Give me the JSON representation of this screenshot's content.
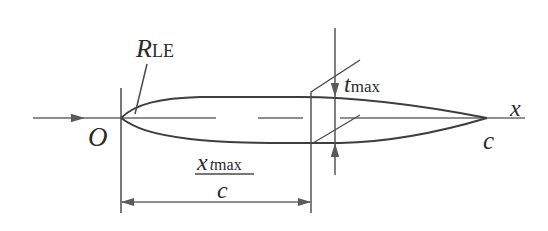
{
  "diagram": {
    "labels": {
      "origin": "O",
      "leading_edge_radius": "R",
      "leading_edge_radius_sub": "LE",
      "max_thickness": "t",
      "max_thickness_sub": "max",
      "x_axis": "x",
      "chord_end": "c",
      "position_numerator": "x",
      "position_numerator_sub": "tmax",
      "position_numerator_sub_italic": "t",
      "position_numerator_sub_rest": "max",
      "position_denominator": "c"
    },
    "colors": {
      "stroke": "#4a4a4a",
      "text": "#2a2a2a",
      "background": "#ffffff"
    }
  }
}
